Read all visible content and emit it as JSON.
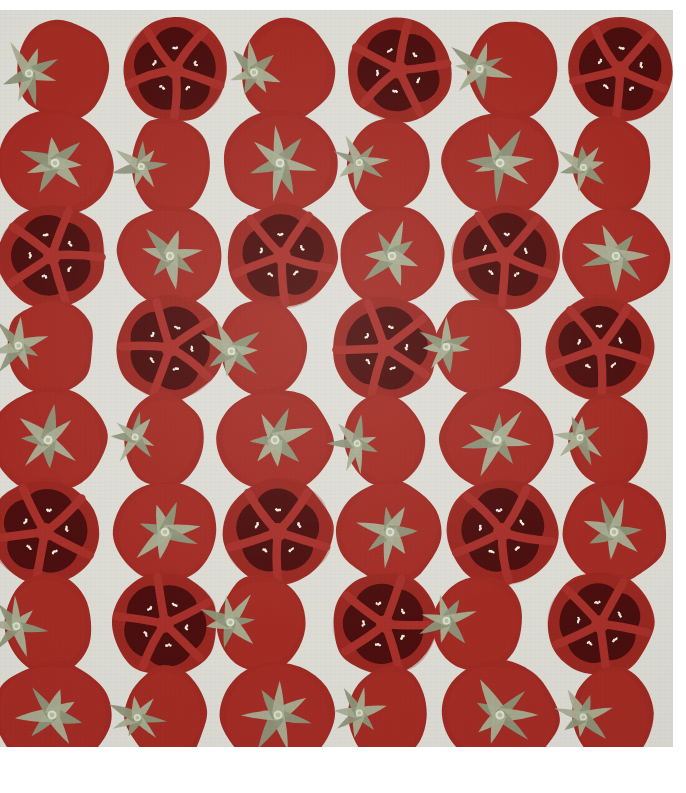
{
  "image": {
    "title": "Tomato pattern flat-lay",
    "description": "Repeating grid pattern of whole and halved red tomatoes on a light grey paper background",
    "width": 686,
    "height": 793,
    "subject": "tomatoes",
    "style": "flat-lay repeating pattern"
  },
  "canvas": {
    "outer_background": "#ffffff",
    "board_background": "#dcdbd4",
    "board_left": 0,
    "board_top": 10,
    "board_width": 673,
    "board_height": 737
  },
  "palette": {
    "paper_grey": "#dcdbd4",
    "paper_grey_shadow": "#d2d1c9",
    "tomato_red": "#9e2a23",
    "tomato_red_dark": "#8a231d",
    "tomato_red_light": "#ac322a",
    "locule_dark": "#4a0f0e",
    "locule_darker": "#3c0b0b",
    "flesh_divider": "#a6302a",
    "seed_cream": "#f4efe0",
    "calyx_green": "#8d9479",
    "calyx_green_light": "#a7ad92",
    "calyx_green_dark": "#767d63",
    "calyx_center": "#d9dcc7",
    "white_margin": "#ffffff"
  },
  "grid": {
    "rows": 8,
    "columns": 6,
    "column_centers": [
      62,
      175,
      287,
      399,
      512,
      616
    ],
    "row_centers": [
      70,
      163,
      255,
      348,
      440,
      532,
      624,
      711
    ],
    "row_patterns": [
      "side-half-side-half-side-half",
      "round-side-round-side-round-side",
      "half-round-half-round-half-round",
      "side-half-side-half-side-half",
      "round-side-round-side-round-side",
      "half-round-half-round-half-round",
      "side-half-side-half-side-half",
      "round-side-round-side-round-side"
    ]
  },
  "tomato_types": {
    "half": {
      "label": "halved tomato cross-section",
      "locule_count": 5,
      "seeds_per_locule": 4,
      "has_calyx": false
    },
    "round": {
      "label": "whole tomato top view",
      "calyx_points": 7,
      "has_calyx": true
    },
    "side": {
      "label": "whole tomato side view",
      "calyx_points": 7,
      "has_calyx": true
    }
  },
  "tomatoes": [
    {
      "row": 0,
      "col": 0,
      "type": "side",
      "cx": 62,
      "cy": 70,
      "rx": 46,
      "ry": 50,
      "rot": -6,
      "seed": 11
    },
    {
      "row": 0,
      "col": 1,
      "type": "half",
      "cx": 175,
      "cy": 70,
      "rx": 52,
      "ry": 52,
      "rot": 4,
      "seed": 12
    },
    {
      "row": 0,
      "col": 2,
      "type": "side",
      "cx": 287,
      "cy": 70,
      "rx": 46,
      "ry": 50,
      "rot": -4,
      "seed": 13
    },
    {
      "row": 0,
      "col": 3,
      "type": "half",
      "cx": 399,
      "cy": 70,
      "rx": 53,
      "ry": 52,
      "rot": -8,
      "seed": 14
    },
    {
      "row": 0,
      "col": 4,
      "type": "side",
      "cx": 512,
      "cy": 70,
      "rx": 45,
      "ry": 50,
      "rot": 2,
      "seed": 15
    },
    {
      "row": 0,
      "col": 5,
      "type": "half",
      "cx": 620,
      "cy": 70,
      "rx": 52,
      "ry": 52,
      "rot": 6,
      "seed": 16
    },
    {
      "row": 1,
      "col": 0,
      "type": "round",
      "cx": 55,
      "cy": 163,
      "rx": 58,
      "ry": 52,
      "rot": 6,
      "seed": 21
    },
    {
      "row": 1,
      "col": 1,
      "type": "side",
      "cx": 170,
      "cy": 165,
      "rx": 40,
      "ry": 48,
      "rot": -3,
      "seed": 22
    },
    {
      "row": 1,
      "col": 2,
      "type": "round",
      "cx": 280,
      "cy": 163,
      "rx": 56,
      "ry": 52,
      "rot": -7,
      "seed": 23
    },
    {
      "row": 1,
      "col": 3,
      "type": "side",
      "cx": 388,
      "cy": 165,
      "rx": 40,
      "ry": 48,
      "rot": 5,
      "seed": 24
    },
    {
      "row": 1,
      "col": 4,
      "type": "round",
      "cx": 500,
      "cy": 163,
      "rx": 57,
      "ry": 52,
      "rot": 3,
      "seed": 25
    },
    {
      "row": 1,
      "col": 5,
      "type": "side",
      "cx": 612,
      "cy": 165,
      "rx": 40,
      "ry": 48,
      "rot": -5,
      "seed": 26
    },
    {
      "row": 2,
      "col": 0,
      "type": "half",
      "cx": 52,
      "cy": 256,
      "rx": 54,
      "ry": 52,
      "rot": -5,
      "seed": 31
    },
    {
      "row": 2,
      "col": 1,
      "type": "round",
      "cx": 170,
      "cy": 256,
      "rx": 52,
      "ry": 50,
      "rot": 8,
      "seed": 32
    },
    {
      "row": 2,
      "col": 2,
      "type": "half",
      "cx": 282,
      "cy": 256,
      "rx": 54,
      "ry": 52,
      "rot": 3,
      "seed": 33
    },
    {
      "row": 2,
      "col": 3,
      "type": "round",
      "cx": 392,
      "cy": 256,
      "rx": 52,
      "ry": 50,
      "rot": -6,
      "seed": 34
    },
    {
      "row": 2,
      "col": 4,
      "type": "half",
      "cx": 505,
      "cy": 256,
      "rx": 54,
      "ry": 52,
      "rot": 7,
      "seed": 35
    },
    {
      "row": 2,
      "col": 5,
      "type": "round",
      "cx": 616,
      "cy": 256,
      "rx": 52,
      "ry": 50,
      "rot": -2,
      "seed": 36
    },
    {
      "row": 3,
      "col": 0,
      "type": "side",
      "cx": 50,
      "cy": 348,
      "rx": 44,
      "ry": 48,
      "rot": 4,
      "seed": 41
    },
    {
      "row": 3,
      "col": 1,
      "type": "half",
      "cx": 170,
      "cy": 348,
      "rx": 53,
      "ry": 52,
      "rot": -4,
      "seed": 42
    },
    {
      "row": 3,
      "col": 2,
      "type": "side",
      "cx": 263,
      "cy": 348,
      "rx": 44,
      "ry": 48,
      "rot": -6,
      "seed": 43
    },
    {
      "row": 3,
      "col": 3,
      "type": "half",
      "cx": 385,
      "cy": 348,
      "rx": 53,
      "ry": 52,
      "rot": 6,
      "seed": 44
    },
    {
      "row": 3,
      "col": 4,
      "type": "side",
      "cx": 478,
      "cy": 348,
      "rx": 44,
      "ry": 48,
      "rot": 2,
      "seed": 45
    },
    {
      "row": 3,
      "col": 5,
      "type": "half",
      "cx": 600,
      "cy": 348,
      "rx": 53,
      "ry": 52,
      "rot": -3,
      "seed": 46
    },
    {
      "row": 4,
      "col": 0,
      "type": "round",
      "cx": 48,
      "cy": 440,
      "rx": 58,
      "ry": 52,
      "rot": -5,
      "seed": 51
    },
    {
      "row": 4,
      "col": 1,
      "type": "side",
      "cx": 163,
      "cy": 440,
      "rx": 39,
      "ry": 47,
      "rot": 6,
      "seed": 52
    },
    {
      "row": 4,
      "col": 2,
      "type": "round",
      "cx": 275,
      "cy": 440,
      "rx": 57,
      "ry": 52,
      "rot": 4,
      "seed": 53
    },
    {
      "row": 4,
      "col": 3,
      "type": "side",
      "cx": 385,
      "cy": 440,
      "rx": 39,
      "ry": 47,
      "rot": -7,
      "seed": 54
    },
    {
      "row": 4,
      "col": 4,
      "type": "round",
      "cx": 497,
      "cy": 440,
      "rx": 57,
      "ry": 52,
      "rot": 2,
      "seed": 55
    },
    {
      "row": 4,
      "col": 5,
      "type": "side",
      "cx": 608,
      "cy": 440,
      "rx": 39,
      "ry": 47,
      "rot": 5,
      "seed": 56
    },
    {
      "row": 5,
      "col": 0,
      "type": "half",
      "cx": 45,
      "cy": 532,
      "rx": 55,
      "ry": 53,
      "rot": 6,
      "seed": 61
    },
    {
      "row": 5,
      "col": 1,
      "type": "round",
      "cx": 165,
      "cy": 532,
      "rx": 52,
      "ry": 51,
      "rot": -4,
      "seed": 62
    },
    {
      "row": 5,
      "col": 2,
      "type": "half",
      "cx": 278,
      "cy": 532,
      "rx": 55,
      "ry": 53,
      "rot": -7,
      "seed": 63
    },
    {
      "row": 5,
      "col": 3,
      "type": "round",
      "cx": 390,
      "cy": 532,
      "rx": 52,
      "ry": 51,
      "rot": 5,
      "seed": 64
    },
    {
      "row": 5,
      "col": 4,
      "type": "half",
      "cx": 502,
      "cy": 532,
      "rx": 55,
      "ry": 53,
      "rot": 3,
      "seed": 65
    },
    {
      "row": 5,
      "col": 5,
      "type": "round",
      "cx": 614,
      "cy": 532,
      "rx": 52,
      "ry": 51,
      "rot": -6,
      "seed": 66
    },
    {
      "row": 6,
      "col": 0,
      "type": "side",
      "cx": 48,
      "cy": 624,
      "rx": 44,
      "ry": 49,
      "rot": -4,
      "seed": 71
    },
    {
      "row": 6,
      "col": 1,
      "type": "half",
      "cx": 165,
      "cy": 624,
      "rx": 53,
      "ry": 52,
      "rot": 5,
      "seed": 72
    },
    {
      "row": 6,
      "col": 2,
      "type": "side",
      "cx": 262,
      "cy": 624,
      "rx": 44,
      "ry": 49,
      "rot": 3,
      "seed": 73
    },
    {
      "row": 6,
      "col": 3,
      "type": "half",
      "cx": 385,
      "cy": 624,
      "rx": 53,
      "ry": 52,
      "rot": -6,
      "seed": 74
    },
    {
      "row": 6,
      "col": 4,
      "type": "side",
      "cx": 478,
      "cy": 624,
      "rx": 44,
      "ry": 49,
      "rot": 6,
      "seed": 75
    },
    {
      "row": 6,
      "col": 5,
      "type": "half",
      "cx": 600,
      "cy": 624,
      "rx": 53,
      "ry": 52,
      "rot": -2,
      "seed": 76
    },
    {
      "row": 7,
      "col": 0,
      "type": "round",
      "cx": 52,
      "cy": 715,
      "rx": 58,
      "ry": 53,
      "rot": 5,
      "seed": 81
    },
    {
      "row": 7,
      "col": 1,
      "type": "side",
      "cx": 166,
      "cy": 715,
      "rx": 40,
      "ry": 48,
      "rot": -5,
      "seed": 82
    },
    {
      "row": 7,
      "col": 2,
      "type": "round",
      "cx": 278,
      "cy": 715,
      "rx": 57,
      "ry": 53,
      "rot": -3,
      "seed": 83
    },
    {
      "row": 7,
      "col": 3,
      "type": "side",
      "cx": 388,
      "cy": 715,
      "rx": 40,
      "ry": 48,
      "rot": 4,
      "seed": 84
    },
    {
      "row": 7,
      "col": 4,
      "type": "round",
      "cx": 500,
      "cy": 715,
      "rx": 58,
      "ry": 53,
      "rot": 6,
      "seed": 85
    },
    {
      "row": 7,
      "col": 5,
      "type": "side",
      "cx": 612,
      "cy": 715,
      "rx": 40,
      "ry": 48,
      "rot": -4,
      "seed": 86
    }
  ]
}
